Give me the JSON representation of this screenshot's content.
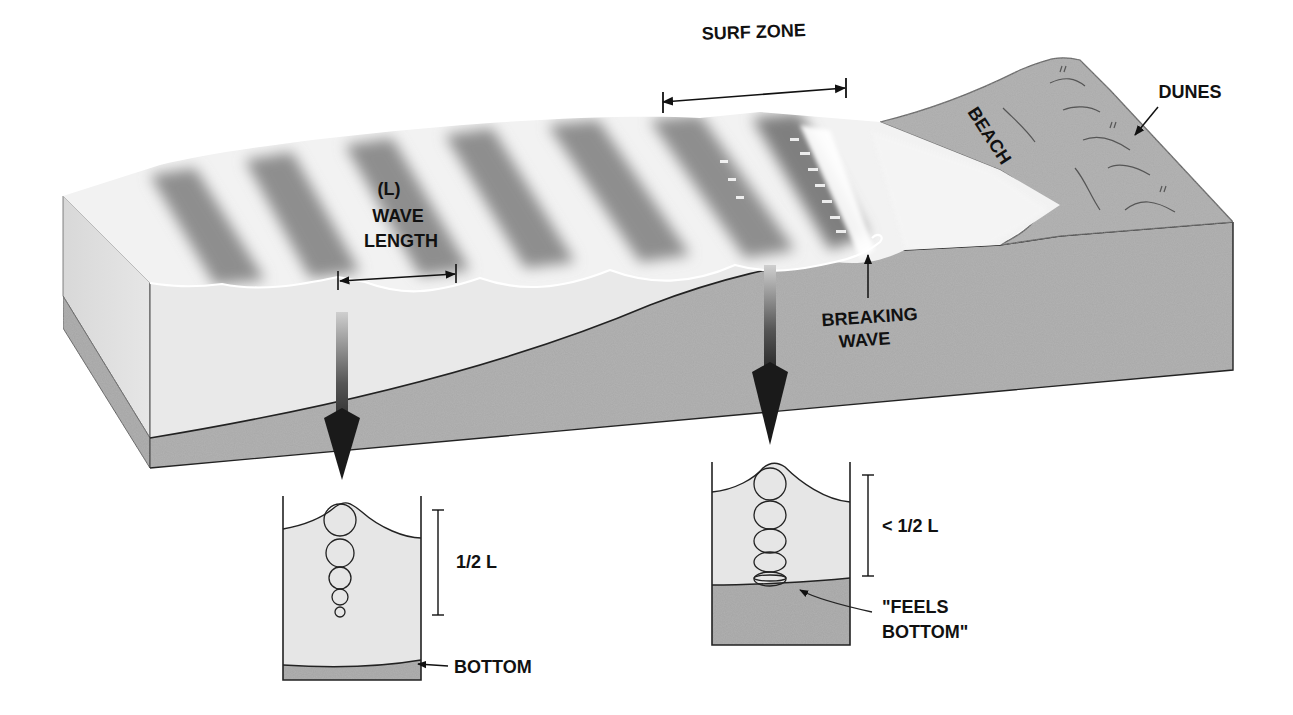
{
  "diagram": {
    "colors": {
      "background": "#ffffff",
      "water_side": "#e9e9e9",
      "water_top_light": "#f4f4f4",
      "wave_trough_shade": "#8c8c8c",
      "sand": "#a9a9a9",
      "outline": "#333333",
      "text": "#111111"
    }
  },
  "labels": {
    "surf_zone": "SURF ZONE",
    "dunes": "DUNES",
    "beach": "BEACH",
    "wave_length_symbol": "(L)",
    "wave_length_line1": "WAVE",
    "wave_length_line2": "LENGTH",
    "breaking_wave_line1": "BREAKING",
    "breaking_wave_line2": "WAVE"
  },
  "insets": [
    {
      "id": "deep-water",
      "depth_label": "1/2 L",
      "bottom_label": "BOTTOM",
      "orbit_count": 5,
      "orbit_shape": "circular, decreasing with depth"
    },
    {
      "id": "shallow-water",
      "depth_label": "< 1/2 L",
      "bottom_label_line1": "\"FEELS",
      "bottom_label_line2": "BOTTOM\"",
      "orbit_count": 6,
      "orbit_shape": "elliptical, flattening toward bottom"
    }
  ]
}
